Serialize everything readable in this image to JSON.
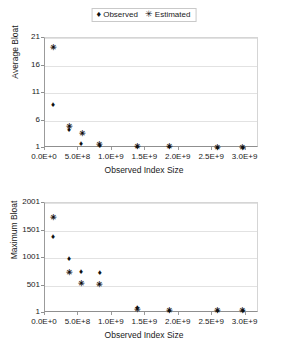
{
  "legend": {
    "entries": [
      {
        "marker": "♦",
        "label": "Observed",
        "marker_name": "diamond-marker"
      },
      {
        "marker": "✳",
        "label": "Estimated",
        "marker_name": "asterisk-marker"
      }
    ]
  },
  "chart_data": [
    {
      "id": "average-bloat",
      "type": "scatter",
      "title": "",
      "xlabel": "Observed Index Size",
      "ylabel": "Average Bloat",
      "xlim": [
        0,
        3200000000
      ],
      "ylim": [
        1,
        21
      ],
      "grid": true,
      "legend_position": "top-center",
      "xticks": [
        0,
        500000000,
        1000000000,
        1500000000,
        2000000000,
        2500000000,
        3000000000
      ],
      "xticklabels": [
        "0.0E+0",
        "5.0E+8",
        "1.0E+9",
        "1.5E+9",
        "2.0E+9",
        "2.5E+9",
        "3.0E+9"
      ],
      "yticks": [
        1,
        6,
        11,
        16,
        21
      ],
      "yticklabels": [
        "1",
        "6",
        "11",
        "16",
        "21"
      ],
      "series": [
        {
          "name": "Observed",
          "marker": "♦",
          "points": [
            {
              "x": 120000000,
              "y": 8.8
            },
            {
              "x": 360000000,
              "y": 4.2
            },
            {
              "x": 540000000,
              "y": 1.8
            },
            {
              "x": 820000000,
              "y": 1.3
            },
            {
              "x": 1380000000,
              "y": 1.1
            },
            {
              "x": 1860000000,
              "y": 1.1
            },
            {
              "x": 2580000000,
              "y": 1.05
            },
            {
              "x": 2960000000,
              "y": 1.05
            }
          ]
        },
        {
          "name": "Estimated",
          "marker": "✳",
          "points": [
            {
              "x": 120000000,
              "y": 19.2
            },
            {
              "x": 360000000,
              "y": 4.9
            },
            {
              "x": 560000000,
              "y": 3.5
            },
            {
              "x": 820000000,
              "y": 1.5
            },
            {
              "x": 1380000000,
              "y": 1.1
            },
            {
              "x": 1860000000,
              "y": 1.1
            },
            {
              "x": 2580000000,
              "y": 1.05
            },
            {
              "x": 2960000000,
              "y": 1.05
            }
          ]
        }
      ]
    },
    {
      "id": "maximum-bloat",
      "type": "scatter",
      "title": "",
      "xlabel": "Observed Index Size",
      "ylabel": "Maximum Bloat",
      "xlim": [
        0,
        3200000000
      ],
      "ylim": [
        1,
        2001
      ],
      "grid": true,
      "legend_position": "none",
      "xticks": [
        0,
        500000000,
        1000000000,
        1500000000,
        2000000000,
        2500000000,
        3000000000
      ],
      "xticklabels": [
        "0.0E+0",
        "5.0E+8",
        "1.0E+9",
        "1.5E+9",
        "2.0E+9",
        "2.5E+9",
        "3.0E+9"
      ],
      "yticks": [
        1,
        501,
        1001,
        1501,
        2001
      ],
      "yticklabels": [
        "1",
        "501",
        "1001",
        "1501",
        "2001"
      ],
      "series": [
        {
          "name": "Observed",
          "marker": "♦",
          "points": [
            {
              "x": 120000000,
              "y": 1380
            },
            {
              "x": 360000000,
              "y": 975
            },
            {
              "x": 540000000,
              "y": 740
            },
            {
              "x": 820000000,
              "y": 720
            },
            {
              "x": 1380000000,
              "y": 100
            },
            {
              "x": 1860000000,
              "y": 40
            },
            {
              "x": 2580000000,
              "y": 30
            },
            {
              "x": 2960000000,
              "y": 30
            }
          ]
        },
        {
          "name": "Estimated",
          "marker": "✳",
          "points": [
            {
              "x": 120000000,
              "y": 1730
            },
            {
              "x": 360000000,
              "y": 720
            },
            {
              "x": 540000000,
              "y": 520
            },
            {
              "x": 820000000,
              "y": 510
            },
            {
              "x": 1380000000,
              "y": 60
            },
            {
              "x": 1860000000,
              "y": 40
            },
            {
              "x": 2580000000,
              "y": 30
            },
            {
              "x": 2960000000,
              "y": 30
            }
          ]
        }
      ]
    }
  ]
}
